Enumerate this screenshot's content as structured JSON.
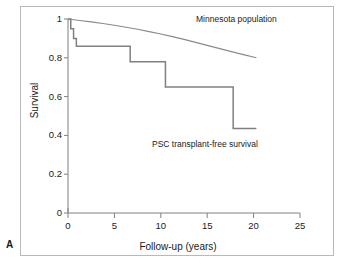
{
  "panel": {
    "label": "A"
  },
  "axes": {
    "x": {
      "title": "Follow-up (years)",
      "ticks": [
        "0",
        "5",
        "10",
        "15",
        "20",
        "25"
      ],
      "range": [
        0,
        25
      ]
    },
    "y": {
      "title": "Survival",
      "ticks": [
        "0",
        "0.2",
        "0.4",
        "0.6",
        "0.8",
        "1"
      ],
      "range": [
        0,
        1
      ]
    }
  },
  "annotations": [
    {
      "name": "minnesota-population-label",
      "text": "Minnesota population"
    },
    {
      "name": "psc-survival-label",
      "text": "PSC transplant-free survival"
    }
  ],
  "colors": {
    "axis": "#808080",
    "curve_minnesota": "#8a8a8a",
    "curve_psc": "#808080",
    "text": "#1a1a1a",
    "frame": "#b9b9b9",
    "background": "#ffffff"
  },
  "chart_data": {
    "type": "line",
    "title": "",
    "subtitle": "",
    "xlabel": "Follow-up (years)",
    "ylabel": "Survival",
    "xlim": [
      0,
      25
    ],
    "ylim": [
      0,
      1
    ],
    "xticks": [
      0,
      5,
      10,
      15,
      20,
      25
    ],
    "yticks": [
      0,
      0.2,
      0.4,
      0.6,
      0.8,
      1
    ],
    "grid": false,
    "legend": "in-plot annotations",
    "series": [
      {
        "name": "Minnesota population",
        "style": "smooth-line",
        "x": [
          0,
          2.5,
          5,
          7.5,
          10,
          12.5,
          15,
          17.5,
          20.3
        ],
        "y": [
          1.0,
          0.985,
          0.968,
          0.947,
          0.923,
          0.895,
          0.864,
          0.833,
          0.8
        ]
      },
      {
        "name": "PSC transplant-free survival",
        "style": "step-post",
        "x": [
          0,
          0.3,
          0.3,
          0.6,
          0.6,
          0.9,
          0.9,
          6.7,
          6.7,
          10.5,
          10.5,
          17.8,
          17.8,
          20.3
        ],
        "y": [
          1.0,
          1.0,
          0.95,
          0.95,
          0.9,
          0.9,
          0.86,
          0.86,
          0.78,
          0.78,
          0.65,
          0.65,
          0.435,
          0.435
        ]
      }
    ]
  }
}
